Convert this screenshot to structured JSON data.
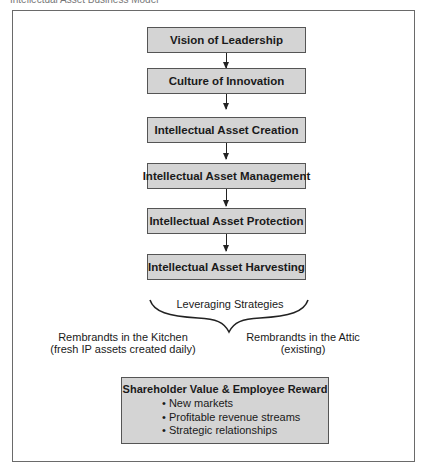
{
  "header": {
    "text": "Intellectual Asset Business Model"
  },
  "flow": {
    "steps": [
      {
        "label": "Vision of Leadership"
      },
      {
        "label": "Culture of Innovation"
      },
      {
        "label": "Intellectual Asset Creation"
      },
      {
        "label": "Intellectual Asset Management"
      },
      {
        "label": "Intellectual Asset Protection"
      },
      {
        "label": "Intellectual Asset Harvesting"
      }
    ]
  },
  "leveraging": {
    "title": "Leveraging Strategies",
    "left": {
      "line1": "Rembrandts in the Kitchen",
      "line2": "(fresh IP assets created daily)"
    },
    "right": {
      "line1": "Rembrandts in the Attic",
      "line2": "(existing)"
    }
  },
  "result": {
    "title": "Shareholder Value & Employee Reward",
    "bullets": [
      "New markets",
      "Profitable revenue streams",
      "Strategic relationships"
    ]
  },
  "colors": {
    "box_fill": "#d4d4d4",
    "border": "#555555"
  }
}
